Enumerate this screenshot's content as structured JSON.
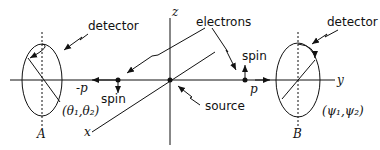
{
  "diagram": {
    "axes": {
      "z": "z",
      "y": "y",
      "x": "x"
    },
    "labels": {
      "detector_left": "detector",
      "detector_right": "detector",
      "electrons": "electrons",
      "source": "source",
      "spin_left": "spin",
      "spin_right": "spin",
      "momentum_left": "-p",
      "momentum_right": "p",
      "angles_left": "(θ₁,θ₂)",
      "angles_right": "(ψ₁,ψ₂)",
      "detector_A": "A",
      "detector_B": "B"
    }
  }
}
